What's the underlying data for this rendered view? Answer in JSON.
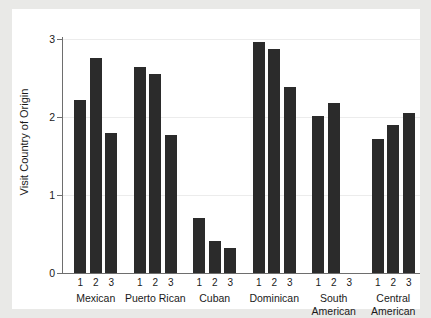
{
  "chart_data": {
    "type": "bar",
    "title": "",
    "subtitle": "",
    "xlabel": "",
    "ylabel": "Visit Country of Origin",
    "ylim": [
      0,
      3
    ],
    "y_ticks": [
      "0",
      "1",
      "2",
      "3"
    ],
    "y_tick_values": [
      0,
      1,
      2,
      3
    ],
    "grid": "horizontal",
    "legend": "none",
    "bar_color": "#2b2b2b",
    "background_color": "#ffffff",
    "figure_background_color": "#e9e9e7",
    "axis_color": "#6e6e6e",
    "gridline_color": "#ececec",
    "within_group_labels": [
      "1",
      "2",
      "3"
    ],
    "categories": [
      "Mexican",
      "Puerto Rican",
      "Cuban",
      "Dominican",
      "South American",
      "Central American"
    ],
    "series": [
      {
        "name": "1",
        "values": [
          2.22,
          2.64,
          0.7,
          2.96,
          2.01,
          1.72
        ]
      },
      {
        "name": "2",
        "values": [
          2.76,
          2.55,
          0.41,
          2.87,
          2.18,
          1.9
        ]
      },
      {
        "name": "3",
        "values": [
          1.79,
          1.77,
          0.32,
          2.38,
          null,
          2.05
        ]
      }
    ],
    "bars": [
      {
        "group": "Mexican",
        "sub": "1",
        "value": 2.22
      },
      {
        "group": "Mexican",
        "sub": "2",
        "value": 2.76
      },
      {
        "group": "Mexican",
        "sub": "3",
        "value": 1.79
      },
      {
        "group": "Puerto Rican",
        "sub": "1",
        "value": 2.64
      },
      {
        "group": "Puerto Rican",
        "sub": "2",
        "value": 2.55
      },
      {
        "group": "Puerto Rican",
        "sub": "3",
        "value": 1.77
      },
      {
        "group": "Cuban",
        "sub": "1",
        "value": 0.7
      },
      {
        "group": "Cuban",
        "sub": "2",
        "value": 0.41
      },
      {
        "group": "Cuban",
        "sub": "3",
        "value": 0.32
      },
      {
        "group": "Dominican",
        "sub": "1",
        "value": 2.96
      },
      {
        "group": "Dominican",
        "sub": "2",
        "value": 2.87
      },
      {
        "group": "Dominican",
        "sub": "3",
        "value": 2.38
      },
      {
        "group": "South American",
        "sub": "1",
        "value": 2.01
      },
      {
        "group": "South American",
        "sub": "2",
        "value": 2.18
      },
      {
        "group": "South American",
        "sub": "3",
        "value": null
      },
      {
        "group": "Central American",
        "sub": "1",
        "value": 1.72
      },
      {
        "group": "Central American",
        "sub": "2",
        "value": 1.9
      },
      {
        "group": "Central American",
        "sub": "3",
        "value": 2.05
      }
    ],
    "group_label_lines": [
      [
        "Mexican",
        ""
      ],
      [
        "Puerto Rican",
        ""
      ],
      [
        "Cuban",
        ""
      ],
      [
        "Dominican",
        ""
      ],
      [
        "South",
        "American"
      ],
      [
        "Central",
        "American"
      ]
    ]
  }
}
